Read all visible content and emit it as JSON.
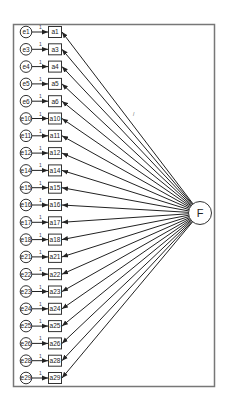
{
  "diagram": {
    "type": "single-factor CFA path diagram",
    "latent_factor": {
      "label": "F"
    },
    "fixed_loading_label": "1",
    "indicators": [
      {
        "error": "e1",
        "observed": "a1"
      },
      {
        "error": "e3",
        "observed": "a3"
      },
      {
        "error": "e4",
        "observed": "a4"
      },
      {
        "error": "e5",
        "observed": "a5"
      },
      {
        "error": "e6",
        "observed": "a6"
      },
      {
        "error": "e10",
        "observed": "a10"
      },
      {
        "error": "e11",
        "observed": "a11"
      },
      {
        "error": "e12",
        "observed": "a12"
      },
      {
        "error": "e14",
        "observed": "a14"
      },
      {
        "error": "e15",
        "observed": "a15"
      },
      {
        "error": "e16",
        "observed": "a16"
      },
      {
        "error": "e17",
        "observed": "a17"
      },
      {
        "error": "e18",
        "observed": "a18"
      },
      {
        "error": "e21",
        "observed": "a21"
      },
      {
        "error": "e22",
        "observed": "a22"
      },
      {
        "error": "e23",
        "observed": "a23"
      },
      {
        "error": "e24",
        "observed": "a24"
      },
      {
        "error": "e25",
        "observed": "a25"
      },
      {
        "error": "e26",
        "observed": "a26"
      },
      {
        "error": "e28",
        "observed": "a28"
      },
      {
        "error": "e29",
        "observed": "a29"
      }
    ],
    "colors": {
      "stroke": "#333333",
      "frame": "#777777",
      "background": "#ffffff"
    }
  }
}
